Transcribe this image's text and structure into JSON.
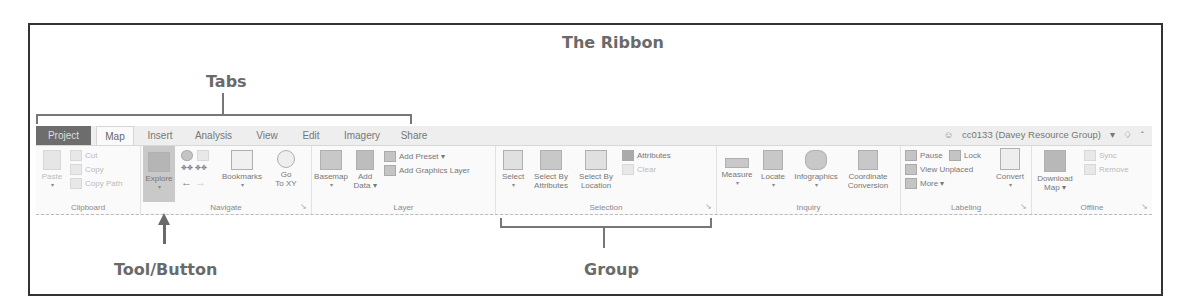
{
  "annotations": {
    "title": "The Ribbon",
    "tabs_label": "Tabs",
    "tool_button_label": "Tool/Button",
    "group_label": "Group"
  },
  "ribbon": {
    "tabs": [
      {
        "label": "Project",
        "state": "backstage"
      },
      {
        "label": "Map",
        "state": "active"
      },
      {
        "label": "Insert"
      },
      {
        "label": "Analysis"
      },
      {
        "label": "View"
      },
      {
        "label": "Edit"
      },
      {
        "label": "Imagery"
      },
      {
        "label": "Share"
      }
    ],
    "user": {
      "icon": "user-icon",
      "name": "cc0133 (Davey Resource Group)",
      "dropdown": "▾",
      "notification_icon": "bell-icon",
      "collapse_icon": "chevron-up-icon"
    },
    "groups": {
      "clipboard": {
        "label": "Clipboard",
        "paste": "Paste",
        "cut": "Cut",
        "copy": "Copy",
        "copy_path": "Copy Path"
      },
      "navigate": {
        "label": "Navigate",
        "explore": "Explore",
        "bookmarks": "Bookmarks",
        "go_to_xy_1": "Go",
        "go_to_xy_2": "To XY"
      },
      "layer": {
        "label": "Layer",
        "basemap": "Basemap",
        "add_data_1": "Add",
        "add_data_2": "Data ▾",
        "add_preset": "Add Preset ▾",
        "add_graphics_layer": "Add Graphics Layer"
      },
      "selection": {
        "label": "Selection",
        "select": "Select",
        "select_by_attributes_1": "Select By",
        "select_by_attributes_2": "Attributes",
        "select_by_location_1": "Select By",
        "select_by_location_2": "Location",
        "attributes": "Attributes",
        "clear": "Clear"
      },
      "inquiry": {
        "label": "Inquiry",
        "measure": "Measure",
        "locate": "Locate",
        "infographics": "Infographics",
        "coordinate_conversion_1": "Coordinate",
        "coordinate_conversion_2": "Conversion"
      },
      "labeling": {
        "label": "Labeling",
        "pause": "Pause",
        "lock": "Lock",
        "view_unplaced": "View Unplaced",
        "more": "More ▾",
        "convert": "Convert"
      },
      "offline": {
        "label": "Offline",
        "download_map_1": "Download",
        "download_map_2": "Map ▾",
        "sync": "Sync",
        "remove": "Remove"
      }
    },
    "dropdown_arrow": "▾",
    "launcher_glyph": "↘"
  }
}
